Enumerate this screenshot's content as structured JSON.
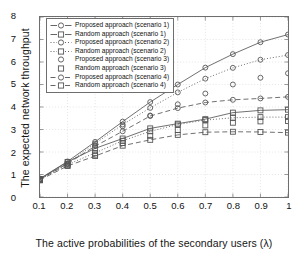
{
  "chart_data": {
    "type": "line",
    "title": "",
    "xlabel": "The active probabilities of the secondary users (λ)",
    "ylabel": "The expected network throughput",
    "x": [
      0.1,
      0.2,
      0.3,
      0.4,
      0.5,
      0.6,
      0.7,
      0.8,
      0.9,
      1.0
    ],
    "xticklabels": [
      "0.1",
      "0.2",
      "0.3",
      "0.4",
      "0.5",
      "0.6",
      "0.7",
      "0.8",
      "0.9",
      "1"
    ],
    "yticklabels": [
      "0",
      "1",
      "2",
      "3",
      "4",
      "5",
      "6",
      "7",
      "8"
    ],
    "xlim": [
      0.1,
      1.0
    ],
    "ylim": [
      0,
      8
    ],
    "grid": true,
    "legend_position": "upper left",
    "series": [
      {
        "name": "Proposed approach (scenario 1)",
        "marker": "circle",
        "linestyle": "solid",
        "color": "#555555",
        "values": [
          0.82,
          1.58,
          2.45,
          3.35,
          4.22,
          5.0,
          5.75,
          6.35,
          6.88,
          7.22
        ]
      },
      {
        "name": "Random approach (scenario 1)",
        "marker": "square",
        "linestyle": "solid",
        "color": "#555555",
        "values": [
          0.8,
          1.56,
          2.16,
          2.6,
          3.05,
          3.26,
          3.46,
          3.75,
          3.85,
          3.88
        ]
      },
      {
        "name": "Proposed approach (scenario 2)",
        "marker": "circle",
        "linestyle": "dotted",
        "color": "#555555",
        "values": [
          0.79,
          1.5,
          2.38,
          3.22,
          3.96,
          4.65,
          5.26,
          5.74,
          6.1,
          6.31
        ]
      },
      {
        "name": "Random approach (scenario 2)",
        "marker": "square",
        "linestyle": "dotted",
        "color": "#555555",
        "values": [
          0.78,
          1.44,
          1.96,
          2.5,
          2.92,
          3.22,
          3.42,
          3.52,
          3.55,
          3.55
        ]
      },
      {
        "name": "Proposed approach (scenario 3)",
        "marker": "circle",
        "linestyle": "none",
        "color": "#555555",
        "values": [
          0.76,
          1.46,
          2.3,
          3.14,
          3.62,
          4.12,
          4.6,
          5.0,
          5.3,
          5.5
        ]
      },
      {
        "name": "Random approach (scenario 3)",
        "marker": "square",
        "linestyle": "none",
        "color": "#555555",
        "values": [
          0.74,
          1.4,
          1.88,
          2.4,
          2.72,
          2.98,
          3.18,
          3.3,
          3.36,
          3.38
        ]
      },
      {
        "name": "Proposed approach (scenario 4)",
        "marker": "circle",
        "linestyle": "dashed",
        "color": "#555555",
        "values": [
          0.8,
          1.48,
          2.26,
          2.92,
          3.6,
          3.95,
          4.2,
          4.32,
          4.38,
          4.45
        ]
      },
      {
        "name": "Random approach (scenario 4)",
        "marker": "square",
        "linestyle": "dashed",
        "color": "#555555",
        "values": [
          0.76,
          1.38,
          1.82,
          2.28,
          2.54,
          2.76,
          2.88,
          2.9,
          2.89,
          2.86
        ]
      }
    ]
  },
  "axes": {
    "y_ticks": [
      "0",
      "1",
      "2",
      "3",
      "4",
      "5",
      "6",
      "7",
      "8"
    ],
    "x_ticks": [
      "0.1",
      "0.2",
      "0.3",
      "0.4",
      "0.5",
      "0.6",
      "0.7",
      "0.8",
      "0.9",
      "1"
    ],
    "y_title": "The expected network throughput",
    "x_title": "The active probabilities of the secondary users (λ)"
  }
}
